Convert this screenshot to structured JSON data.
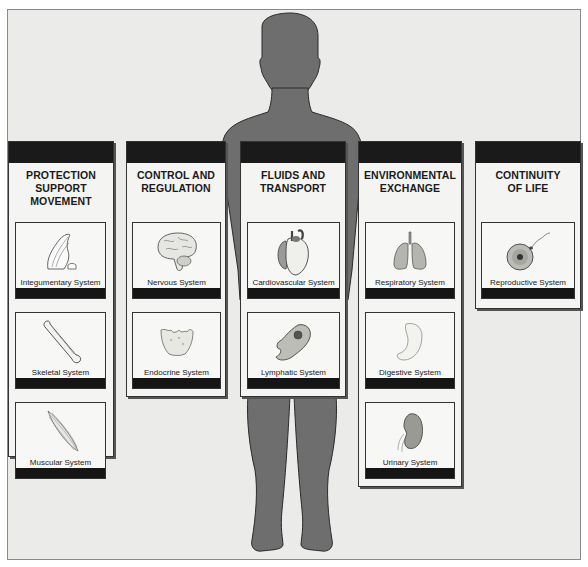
{
  "diagram": {
    "figure": "human-body-silhouette",
    "colors": {
      "background": "#ebebea",
      "silhouette": "#6e6e6e",
      "panel": "#f4f4f2",
      "header_bar": "#1a1a1a"
    },
    "categories": [
      {
        "title": "PROTECTION SUPPORT MOVEMENT",
        "title_lines": [
          "PROTECTION",
          "SUPPORT",
          "MOVEMENT"
        ],
        "systems": [
          {
            "label": "Integumentary System",
            "icon": "skin-finger-icon"
          },
          {
            "label": "Skeletal System",
            "icon": "bone-icon"
          },
          {
            "label": "Muscular System",
            "icon": "muscle-icon"
          }
        ]
      },
      {
        "title": "CONTROL AND REGULATION",
        "title_lines": [
          "CONTROL AND",
          "REGULATION"
        ],
        "systems": [
          {
            "label": "Nervous System",
            "icon": "brain-icon"
          },
          {
            "label": "Endocrine System",
            "icon": "thyroid-gland-icon"
          }
        ]
      },
      {
        "title": "FLUIDS AND TRANSPORT",
        "title_lines": [
          "FLUIDS AND",
          "TRANSPORT"
        ],
        "systems": [
          {
            "label": "Cardiovascular System",
            "icon": "heart-icon"
          },
          {
            "label": "Lymphatic System",
            "icon": "lymphocyte-icon"
          }
        ]
      },
      {
        "title": "ENVIRONMENTAL EXCHANGE",
        "title_lines": [
          "ENVIRONMENTAL",
          "EXCHANGE"
        ],
        "systems": [
          {
            "label": "Respiratory System",
            "icon": "lungs-icon"
          },
          {
            "label": "Digestive System",
            "icon": "stomach-icon"
          },
          {
            "label": "Urinary System",
            "icon": "kidney-icon"
          }
        ]
      },
      {
        "title": "CONTINUITY OF LIFE",
        "title_lines": [
          "CONTINUITY",
          "OF LIFE"
        ],
        "systems": [
          {
            "label": "Reproductive System",
            "icon": "egg-sperm-icon"
          }
        ]
      }
    ]
  }
}
